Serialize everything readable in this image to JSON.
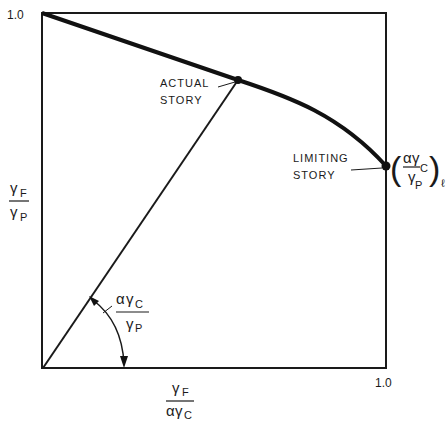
{
  "diagram": {
    "type": "interaction-diagram",
    "ticks": {
      "y_max": "1.0",
      "x_max": "1.0"
    },
    "y_axis_label": {
      "numerator": "γ",
      "numerator_sub": "F",
      "denominator": "γ",
      "denominator_sub": "P"
    },
    "x_axis_label": {
      "numerator": "γ",
      "numerator_sub": "F",
      "denominator_prefix": "α",
      "denominator": "γ",
      "denominator_sub": "C"
    },
    "angle_label": {
      "numerator_prefix": "α",
      "numerator": "γ",
      "numerator_sub": "C",
      "denominator": "γ",
      "denominator_sub": "P"
    },
    "points": [
      {
        "id": "actual",
        "label_line1": "ACTUAL",
        "label_line2": "STORY"
      },
      {
        "id": "limiting",
        "label_line1": "LIMITING",
        "label_line2": "STORY"
      }
    ],
    "limiting_value_label": {
      "open": "(",
      "numerator_prefix": "α",
      "numerator": "γ",
      "numerator_sub": "C",
      "denominator": "γ",
      "denominator_sub": "P",
      "close": ")",
      "outer_sub": "ℓ"
    },
    "colors": {
      "ink": "#1a1a1a",
      "background": "#ffffff"
    }
  }
}
